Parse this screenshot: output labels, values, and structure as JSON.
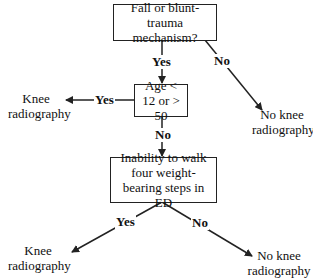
{
  "nodes": {
    "mechanism": {
      "text": "Fall or blunt-trauma mechanism?"
    },
    "age": {
      "text": "Age < 12 or > 50"
    },
    "walk": {
      "text": "Inability to walk four weight-bearing steps in ED"
    }
  },
  "outcomes": {
    "age_yes": "Knee radiography",
    "mechanism_no": "No knee radiography",
    "walk_yes": "Knee radiography",
    "walk_no": "No knee radiography"
  },
  "edges": {
    "mechanism_yes": "Yes",
    "mechanism_no": "No",
    "age_yes": "Yes",
    "age_no": "No",
    "walk_yes": "Yes",
    "walk_no": "No"
  }
}
